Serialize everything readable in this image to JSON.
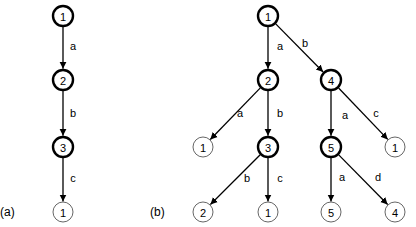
{
  "panels": [
    {
      "id": "a",
      "label": "(a)",
      "label_pos": [
        0,
        212
      ],
      "nodes": [
        {
          "id": "a1",
          "text": "1",
          "x": 63,
          "y": 16,
          "bold": true
        },
        {
          "id": "a2",
          "text": "2",
          "x": 63,
          "y": 80,
          "bold": true
        },
        {
          "id": "a3",
          "text": "3",
          "x": 63,
          "y": 147,
          "bold": true
        },
        {
          "id": "a4",
          "text": "1",
          "x": 63,
          "y": 212,
          "bold": false
        }
      ],
      "edges": [
        {
          "from": "a1",
          "to": "a2",
          "label": "a",
          "lx": 73,
          "ly": 46
        },
        {
          "from": "a2",
          "to": "a3",
          "label": "b",
          "lx": 73,
          "ly": 113
        },
        {
          "from": "a3",
          "to": "a4",
          "label": "c",
          "lx": 73,
          "ly": 178
        }
      ]
    },
    {
      "id": "b",
      "label": "(b)",
      "label_pos": [
        150,
        212
      ],
      "nodes": [
        {
          "id": "b1",
          "text": "1",
          "x": 268,
          "y": 16,
          "bold": true
        },
        {
          "id": "b2",
          "text": "2",
          "x": 268,
          "y": 80,
          "bold": true
        },
        {
          "id": "b4",
          "text": "4",
          "x": 331,
          "y": 80,
          "bold": true
        },
        {
          "id": "b1l",
          "text": "1",
          "x": 203,
          "y": 147,
          "bold": false
        },
        {
          "id": "b3",
          "text": "3",
          "x": 268,
          "y": 147,
          "bold": true
        },
        {
          "id": "b5",
          "text": "5",
          "x": 331,
          "y": 147,
          "bold": true
        },
        {
          "id": "b1r",
          "text": "1",
          "x": 395,
          "y": 147,
          "bold": false
        },
        {
          "id": "b2l",
          "text": "2",
          "x": 203,
          "y": 212,
          "bold": false
        },
        {
          "id": "b1m",
          "text": "1",
          "x": 268,
          "y": 212,
          "bold": false
        },
        {
          "id": "b5l",
          "text": "5",
          "x": 331,
          "y": 212,
          "bold": false
        },
        {
          "id": "b4l",
          "text": "4",
          "x": 395,
          "y": 212,
          "bold": false
        }
      ],
      "edges": [
        {
          "from": "b1",
          "to": "b2",
          "label": "a",
          "lx": 280,
          "ly": 46
        },
        {
          "from": "b1",
          "to": "b4",
          "label": "b",
          "lx": 305,
          "ly": 43
        },
        {
          "from": "b2",
          "to": "b1l",
          "label": "a",
          "lx": 240,
          "ly": 113
        },
        {
          "from": "b2",
          "to": "b3",
          "label": "b",
          "lx": 280,
          "ly": 113
        },
        {
          "from": "b4",
          "to": "b5",
          "label": "a",
          "lx": 345,
          "ly": 115
        },
        {
          "from": "b4",
          "to": "b1r",
          "label": "c",
          "lx": 376,
          "ly": 113
        },
        {
          "from": "b3",
          "to": "b2l",
          "label": "b",
          "lx": 247,
          "ly": 178
        },
        {
          "from": "b3",
          "to": "b1m",
          "label": "c",
          "lx": 280,
          "ly": 178
        },
        {
          "from": "b5",
          "to": "b5l",
          "label": "a",
          "lx": 342,
          "ly": 177
        },
        {
          "from": "b5",
          "to": "b4l",
          "label": "d",
          "lx": 378,
          "ly": 177
        }
      ]
    }
  ],
  "node_radius": 10
}
